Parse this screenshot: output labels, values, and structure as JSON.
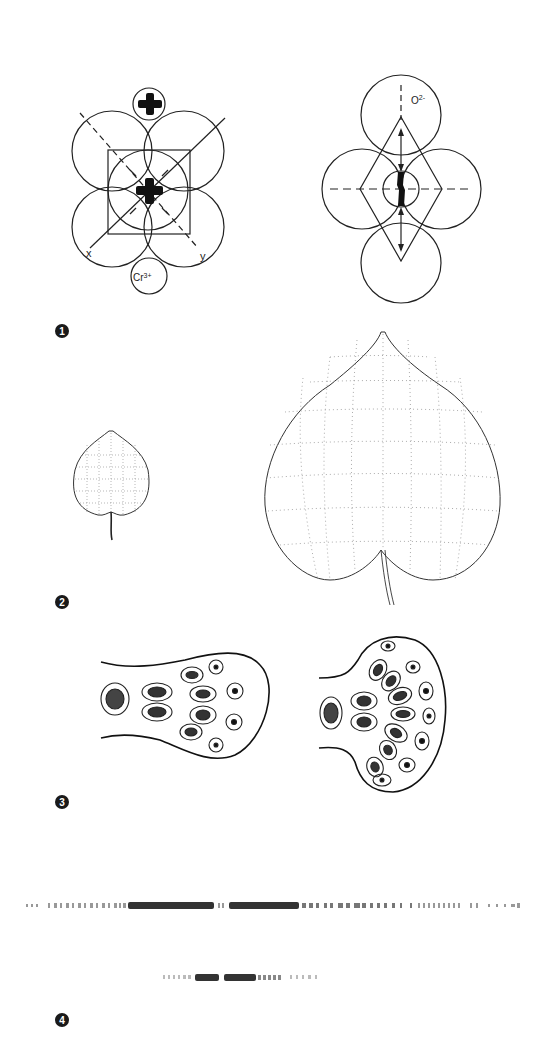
{
  "figure": {
    "panels": [
      {
        "id": 1,
        "label": "1",
        "description": "Crystal field octahedral coordination of Cr3+ ion by O2- ions",
        "annotations": {
          "axis_x": "x",
          "axis_y": "y",
          "cation": "Cr 3+",
          "anion": "O2-"
        }
      },
      {
        "id": 2,
        "label": "2",
        "description": "Small leaf and enlarged leaf with deformed grid lines"
      },
      {
        "id": 3,
        "label": "3",
        "description": "Two cellular cross-sections of club-shaped tissue with nucleated cells"
      },
      {
        "id": 4,
        "label": "4",
        "description": "Two band-like stripe patterns (long and short)"
      }
    ]
  },
  "annotations": {
    "x": "x",
    "y": "y",
    "cr": "Cr",
    "cr_charge": "3+",
    "o": "O",
    "o_charge": "2-"
  },
  "labels": [
    "1",
    "2",
    "3",
    "4"
  ]
}
